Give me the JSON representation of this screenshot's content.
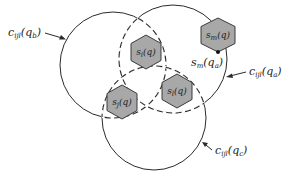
{
  "diagram": {
    "circles": [
      {
        "id": "qb",
        "label_base": "c",
        "label_sub": "ijl",
        "label_arg_base": "q",
        "label_arg_sub": "b"
      },
      {
        "id": "qa",
        "label_base": "c",
        "label_sub": "ijl",
        "label_arg_base": "q",
        "label_arg_sub": "a"
      },
      {
        "id": "qc",
        "label_base": "c",
        "label_sub": "ijl",
        "label_arg_base": "q",
        "label_arg_sub": "c"
      }
    ],
    "servers": [
      {
        "id": "si",
        "base": "s",
        "sub": "i",
        "arg": "(q)"
      },
      {
        "id": "sj",
        "base": "s",
        "sub": "j",
        "arg": "(q)"
      },
      {
        "id": "sl",
        "base": "s",
        "sub": "l",
        "arg": "(q)"
      },
      {
        "id": "sm",
        "base": "s",
        "sub": "m",
        "arg": "(q)"
      }
    ],
    "point_label": {
      "base": "s",
      "sub": "m",
      "arg_base": "q",
      "arg_sub": "a"
    },
    "colors": {
      "hex_fill": "#a8a8a8",
      "stroke": "#2a2a2a"
    }
  }
}
